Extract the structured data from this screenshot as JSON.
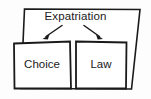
{
  "diagram": {
    "type": "concept-boxes-with-arrows",
    "outer_box": {
      "label": "Expatriation",
      "shape": "skewed-quadrilateral"
    },
    "children": [
      {
        "label": "Choice",
        "position": "left"
      },
      {
        "label": "Law",
        "position": "right"
      }
    ],
    "arrows": [
      {
        "name": "arrow-to-choice",
        "direction": "down-left",
        "from": "Expatriation",
        "to": "Choice"
      },
      {
        "name": "arrow-to-law",
        "direction": "down-right",
        "from": "Expatriation",
        "to": "Law"
      }
    ],
    "colors": {
      "background": "#fdfdfd",
      "stroke": "#1a1a1a",
      "box_fill": "#ffffff",
      "text": "#1a1a1a"
    }
  }
}
